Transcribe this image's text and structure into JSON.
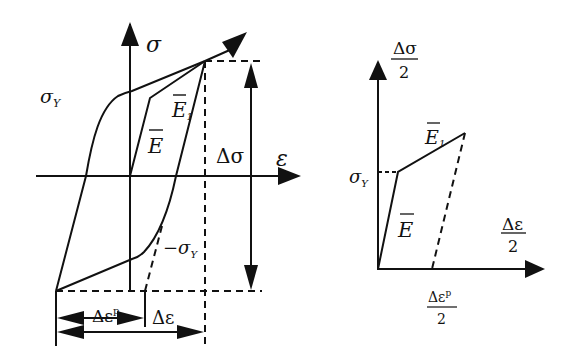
{
  "left_diagram": {
    "y_axis_label": "σ",
    "x_axis_label": "ε",
    "yield_label": "σ",
    "yield_sub": "Y",
    "neg_yield_label": "−σ",
    "neg_yield_sub": "Y",
    "modulus_label": "E",
    "modulus1_label": "E",
    "modulus1_sub": "1",
    "stress_range_label": "Δσ",
    "plastic_strain_label": "Δε",
    "plastic_strain_sup": "p",
    "strain_range_label": "Δε"
  },
  "right_diagram": {
    "y_axis_num": "Δσ",
    "y_axis_den": "2",
    "x_axis_num": "Δε",
    "x_axis_den": "2",
    "yield_label": "σ",
    "yield_sub": "Y",
    "modulus_label": "E",
    "modulus1_label": "E",
    "modulus1_sub": "1",
    "plastic_num": "Δε",
    "plastic_sup": "p",
    "plastic_den": "2"
  },
  "colors": {
    "ink": "#111111",
    "background": "#ffffff"
  }
}
